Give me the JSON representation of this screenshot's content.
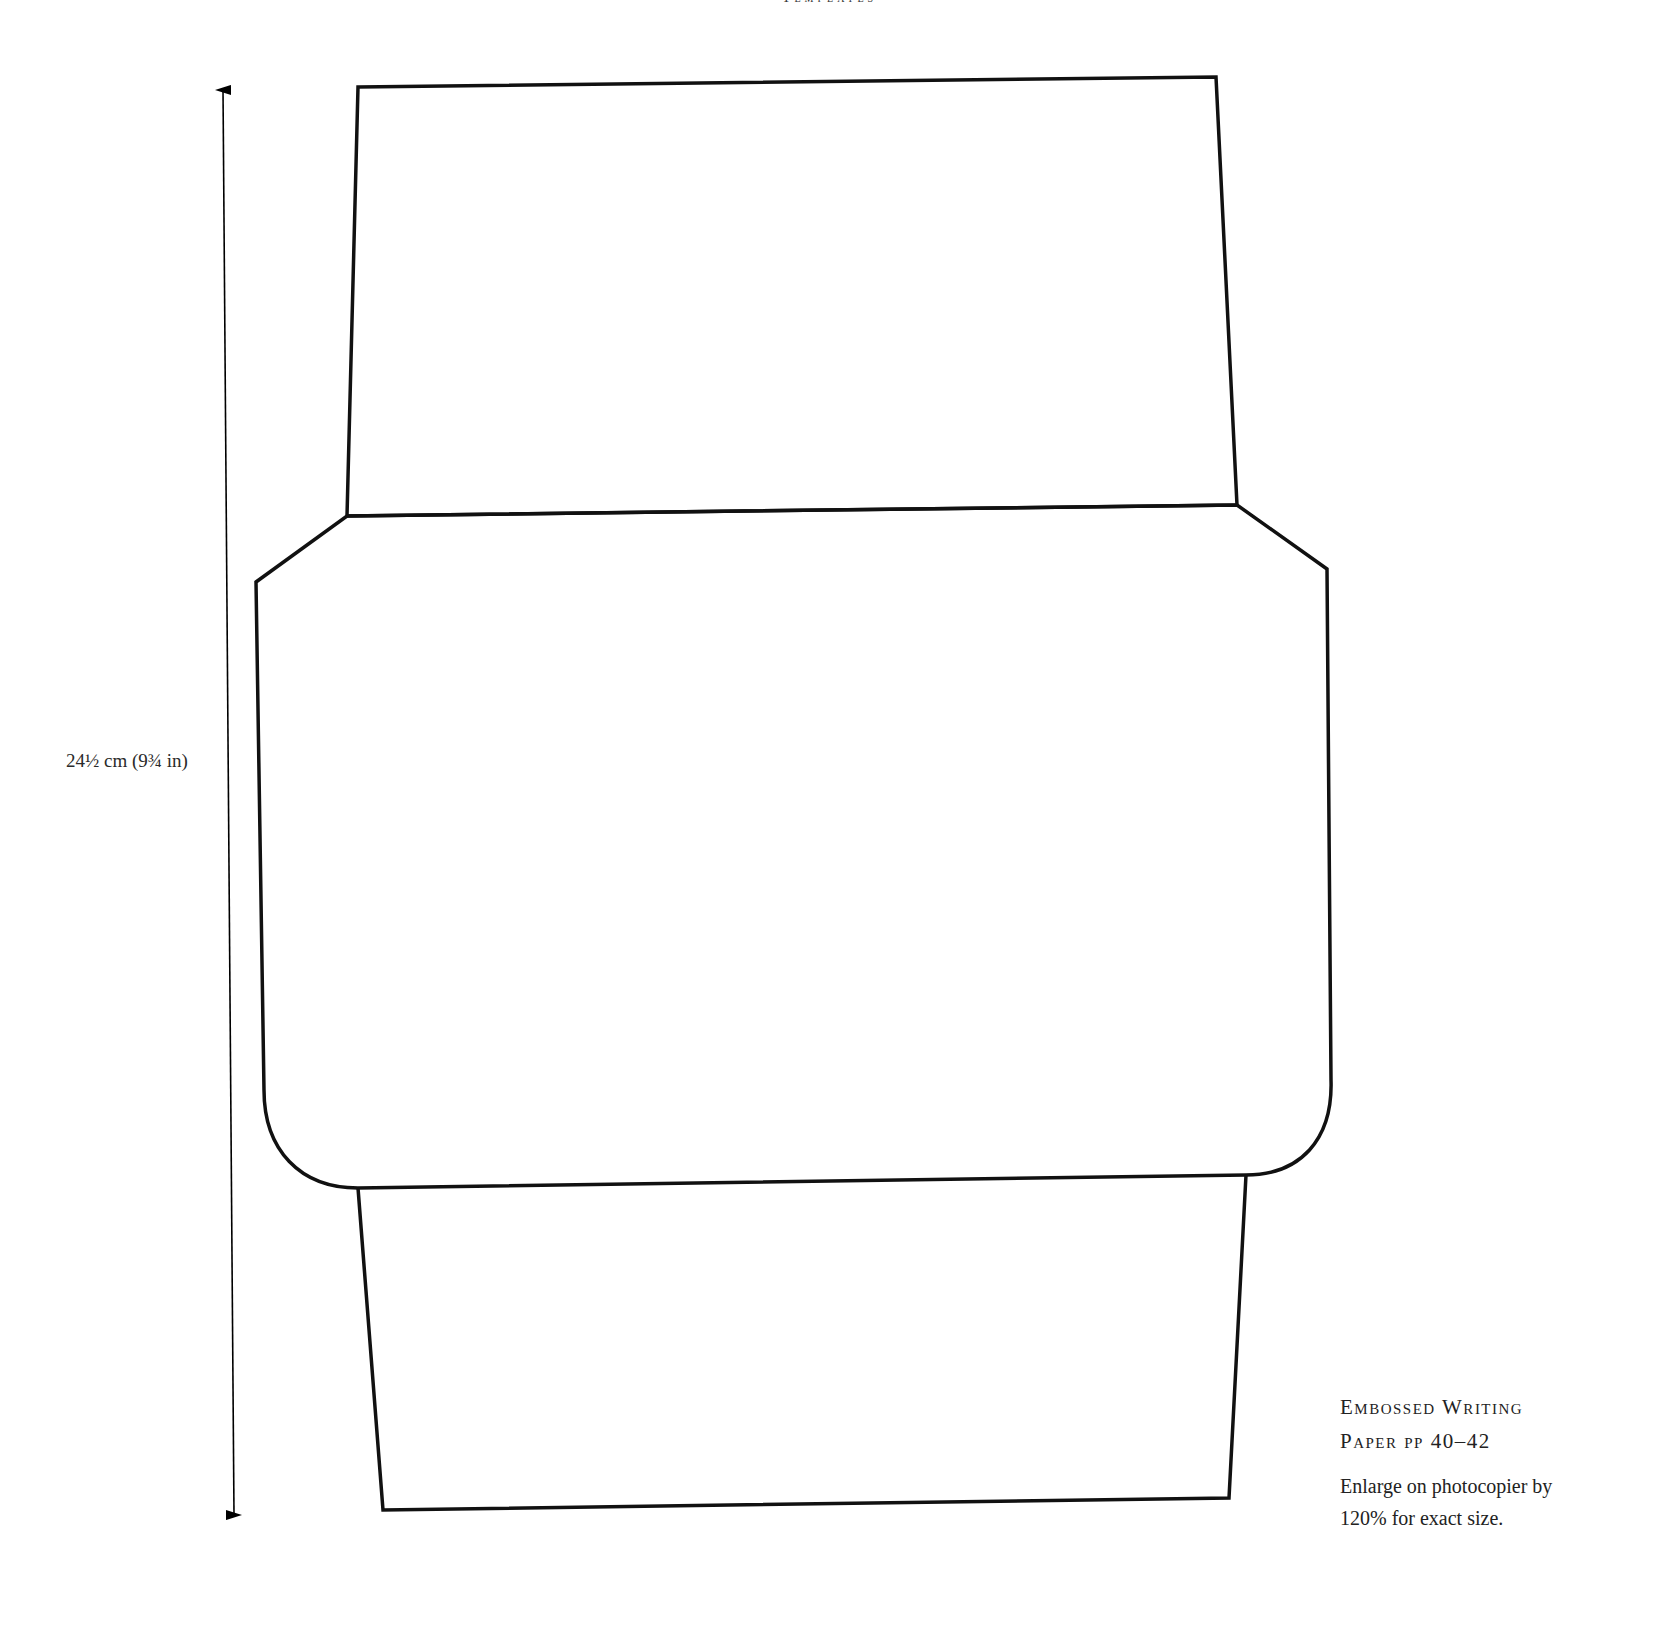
{
  "header": {
    "running_title": "Templates"
  },
  "dimension": {
    "label": "24½ cm (9¾ in)"
  },
  "caption": {
    "title_line1": "Embossed Writing",
    "title_line2": "Paper pp 40–42",
    "note_line1": "Enlarge on photocopier by",
    "note_line2": "120% for exact size."
  },
  "template": {
    "stroke_color": "#111111",
    "parts": [
      "top-flap",
      "envelope-body",
      "bottom-flap"
    ]
  }
}
